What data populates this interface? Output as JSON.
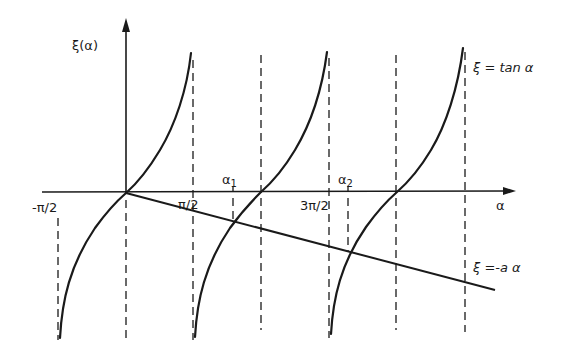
{
  "diagram": {
    "y_axis_label": "ξ(α)",
    "x_axis_label": "α",
    "tick_labels": {
      "neg_pi_half": "-π/2",
      "pi_half": "π/2",
      "three_pi_half": "3π/2"
    },
    "roots": {
      "alpha1": {
        "base": "α",
        "sub": "1"
      },
      "alpha2": {
        "base": "α",
        "sub": "2"
      }
    },
    "curve_labels": {
      "tan": "ξ = tan α",
      "line": "ξ =-a α"
    },
    "colors": {
      "ink": "#1a1a1a",
      "background": "#ffffff"
    }
  }
}
